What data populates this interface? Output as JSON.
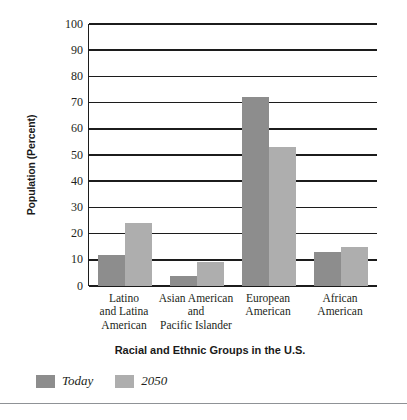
{
  "chart_data": {
    "type": "bar",
    "title": "",
    "xlabel": "Racial and Ethnic Groups in the U.S.",
    "ylabel": "Population (Percent)",
    "ylim": [
      0,
      100
    ],
    "ytick_step": 10,
    "yticks": [
      100,
      90,
      80,
      70,
      60,
      50,
      40,
      30,
      20,
      10,
      0
    ],
    "grid": true,
    "legend_position": "bottom-left",
    "categories": [
      "Latino and Latina American",
      "Asian American and Pacific Islander",
      "European American",
      "African American"
    ],
    "category_lines": [
      [
        "Latino",
        "and Latina",
        "American"
      ],
      [
        "Asian American",
        "and",
        "Pacific Islander"
      ],
      [
        "European",
        "American",
        ""
      ],
      [
        "African",
        "American",
        ""
      ]
    ],
    "series": [
      {
        "name": "Today",
        "color": "#8d8d8d",
        "values": [
          12,
          4,
          72,
          13
        ]
      },
      {
        "name": "2050",
        "color": "#aeaeae",
        "values": [
          24,
          9,
          53,
          15
        ]
      }
    ]
  },
  "axis_color": "#1c1c1c",
  "rule_color": "#8f9296"
}
